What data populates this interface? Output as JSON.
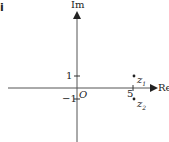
{
  "part_label": "i",
  "axes": {
    "y_label": "Im",
    "x_label": "Re",
    "origin_label": "O",
    "ticks": {
      "y_pos": "1",
      "y_neg": "−1",
      "x": "5"
    }
  },
  "points": [
    {
      "name": "z",
      "sub": "1",
      "re": 5,
      "im": 1
    },
    {
      "name": "z",
      "sub": "2",
      "re": 5,
      "im": -1
    }
  ],
  "colors": {
    "axis": "#555555",
    "text": "#222222"
  }
}
